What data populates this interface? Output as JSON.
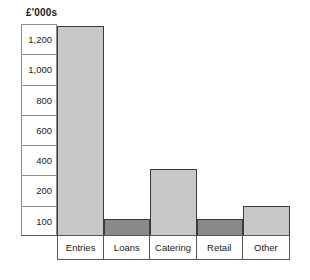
{
  "chart_data": {
    "type": "bar",
    "title": "£'000s",
    "xlabel": "",
    "ylabel": "£'000s",
    "categories": [
      "Entries",
      "Loans",
      "Catering",
      "Retail",
      "Other"
    ],
    "values": [
      1250,
      100,
      400,
      100,
      180
    ],
    "series": [
      {
        "name": "Income",
        "values": [
          1250,
          100,
          400,
          100,
          180
        ]
      }
    ],
    "ytick_labels": [
      "1,200",
      "1,000",
      "800",
      "600",
      "400",
      "200",
      "100"
    ],
    "ytick_values": [
      1200,
      1000,
      800,
      600,
      400,
      200,
      100
    ],
    "ylim": [
      0,
      1260
    ],
    "grid": true,
    "legend": "none",
    "bar_colors": [
      "#c8c8c8",
      "#8a8a8a",
      "#c8c8c8",
      "#8a8a8a",
      "#c8c8c8"
    ]
  },
  "colors": {
    "bar_light": "#c8c8c8",
    "bar_dark": "#8a8a8a",
    "bar_border": "#3a3a3a",
    "axis_line": "#8d8d8d",
    "frame_line": "#555555",
    "text": "#1a1a1a",
    "background": "#ffffff"
  }
}
